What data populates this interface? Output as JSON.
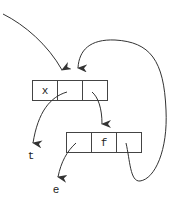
{
  "diagram": {
    "type": "linked-cons-cells",
    "colors": {
      "stroke": "#444444",
      "text": "#222222",
      "background": "#ffffff"
    },
    "nodes": [
      {
        "id": "top-cell",
        "cells": [
          "x",
          "",
          ""
        ]
      },
      {
        "id": "bottom-cell",
        "cells": [
          "",
          "f",
          ""
        ]
      }
    ],
    "labels": {
      "t": "t",
      "e": "e"
    },
    "edges": [
      {
        "from": "external",
        "to": "top-cell"
      },
      {
        "from": "top-cell.1",
        "to": "t"
      },
      {
        "from": "top-cell.2",
        "to": "bottom-cell"
      },
      {
        "from": "bottom-cell.0",
        "to": "e"
      },
      {
        "from": "bottom-cell.2",
        "to": "top-cell"
      }
    ]
  }
}
